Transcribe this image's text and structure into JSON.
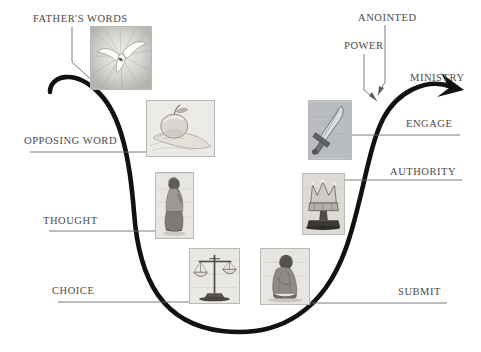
{
  "diagram": {
    "curve_color": "#111111",
    "label_color": "#4a4a4a",
    "leader_color": "#6b6b6b",
    "background": "#ffffff",
    "arrow_direction": "up-right"
  },
  "labels": [
    {
      "id": "fathers-words",
      "text": "FATHER'S WORDS",
      "x": 33,
      "y": 13,
      "side": "left"
    },
    {
      "id": "opposing-word",
      "text": "OPPOSING WORD",
      "x": 24,
      "y": 135,
      "side": "left"
    },
    {
      "id": "thought",
      "text": "THOUGHT",
      "x": 43,
      "y": 215,
      "side": "left"
    },
    {
      "id": "choice",
      "text": "CHOICE",
      "x": 52,
      "y": 285,
      "side": "left"
    },
    {
      "id": "submit",
      "text": "SUBMIT",
      "x": 398,
      "y": 286,
      "side": "right"
    },
    {
      "id": "authority",
      "text": "AUTHORITY",
      "x": 390,
      "y": 166,
      "side": "right"
    },
    {
      "id": "engage",
      "text": "ENGAGE",
      "x": 406,
      "y": 118,
      "side": "right"
    },
    {
      "id": "ministry",
      "text": "MINISTRY",
      "x": 410,
      "y": 72,
      "side": "right"
    },
    {
      "id": "power",
      "text": "POWER",
      "x": 344,
      "y": 40,
      "side": "right"
    },
    {
      "id": "anointed",
      "text": "ANOINTED",
      "x": 358,
      "y": 12,
      "side": "right"
    }
  ],
  "images": [
    {
      "id": "dove-image",
      "subject": "dove-descending-in-light-rays",
      "x": 90,
      "y": 26,
      "w": 62,
      "h": 64,
      "label": "fathers-words"
    },
    {
      "id": "apple-image",
      "subject": "apple-in-open-hand",
      "x": 146,
      "y": 100,
      "w": 69,
      "h": 57,
      "label": "opposing-word"
    },
    {
      "id": "thinker-image",
      "subject": "seated-person-thinking",
      "x": 155,
      "y": 172,
      "w": 39,
      "h": 67,
      "label": "thought"
    },
    {
      "id": "scales-image",
      "subject": "balance-scales",
      "x": 189,
      "y": 248,
      "w": 51,
      "h": 56,
      "label": "choice"
    },
    {
      "id": "kneeling-image",
      "subject": "kneeling-bowed-figure",
      "x": 260,
      "y": 248,
      "w": 50,
      "h": 57,
      "label": "submit"
    },
    {
      "id": "crown-image",
      "subject": "crown-on-pedestal",
      "x": 302,
      "y": 173,
      "w": 43,
      "h": 62,
      "label": "authority"
    },
    {
      "id": "sword-image",
      "subject": "upright-sword",
      "x": 308,
      "y": 100,
      "w": 44,
      "h": 60,
      "label": "engage"
    }
  ],
  "leader_lines": [
    {
      "id": "leader-fathers-words",
      "from_label": "fathers-words",
      "to_image": "dove-image",
      "path": "M 77 26 L 77 64 L 97 84",
      "dot": [
        97,
        84
      ]
    },
    {
      "id": "leader-opposing-word",
      "from_label": "opposing-word",
      "to_image": "apple-image",
      "path": "M 30 152 L 152 152",
      "dot": [
        152,
        152
      ]
    },
    {
      "id": "leader-thought",
      "from_label": "thought",
      "to_image": "thinker-image",
      "path": "M 49 231 L 162 231",
      "dot": [
        162,
        231
      ]
    },
    {
      "id": "leader-choice",
      "from_label": "choice",
      "to_image": "scales-image",
      "path": "M 58 302 L 196 302",
      "dot": [
        196,
        302
      ]
    },
    {
      "id": "leader-submit",
      "from_label": "submit",
      "to_image": "kneeling-image",
      "path": "M 445 303 L 304 303",
      "dot": [
        304,
        303
      ]
    },
    {
      "id": "leader-authority",
      "from_label": "authority",
      "to_image": "crown-image",
      "path": "M 460 180 L 337 180",
      "dot": [
        337,
        180
      ]
    },
    {
      "id": "leader-engage",
      "from_label": "engage",
      "to_image": "sword-image",
      "path": "M 458 135 L 344 135",
      "dot": [
        344,
        135
      ]
    },
    {
      "id": "leader-power",
      "from_label": "power",
      "to_curve": true,
      "path": "M 366 53 L 366 92 L 378 101",
      "arrow": true
    },
    {
      "id": "leader-anointed",
      "from_label": "anointed",
      "to_curve": true,
      "path": "M 386 25 L 386 83 L 379 95",
      "arrow": true
    },
    {
      "id": "leader-ministry",
      "from_label": "ministry",
      "to_curve": false,
      "path": "",
      "dot": null
    }
  ],
  "curve": {
    "id": "u-curve",
    "description": "thick black U-shaped arrow from upper-left down through the valley and up to the right",
    "path": "M 50 92 C 52 78 78 72 102 96 C 124 118 130 160 134 210 C 139 280 160 322 218 330 C 276 338 322 312 345 250 C 362 205 368 150 382 120 C 396 92 424 78 452 88",
    "stroke_width": 4.5,
    "arrow_tip": [
      462,
      91
    ]
  }
}
